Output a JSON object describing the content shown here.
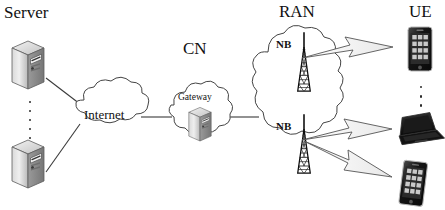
{
  "diagram": {
    "type": "network-topology",
    "background_color": "#ffffff",
    "line_color": "#333333",
    "groups": [
      {
        "id": "server",
        "label": "Server"
      },
      {
        "id": "cn",
        "label": "CN"
      },
      {
        "id": "ran",
        "label": "RAN"
      },
      {
        "id": "ue",
        "label": "UE"
      }
    ],
    "clouds": [
      {
        "id": "internet",
        "label": "Internet"
      },
      {
        "id": "cn-cloud",
        "label": ""
      },
      {
        "id": "ran-cloud",
        "label": ""
      }
    ],
    "nodes": [
      {
        "id": "server-top",
        "label": "",
        "icon": "server-tower-icon"
      },
      {
        "id": "server-bottom",
        "label": "",
        "icon": "server-tower-icon"
      },
      {
        "id": "gateway",
        "label": "Gateway",
        "icon": "server-tower-icon"
      },
      {
        "id": "nodeb-top",
        "label": "NB",
        "icon": "cell-tower-icon"
      },
      {
        "id": "nodeb-bottom",
        "label": "NB",
        "icon": "cell-tower-icon"
      },
      {
        "id": "ue-phone-top",
        "label": "",
        "icon": "smartphone-icon"
      },
      {
        "id": "ue-laptop",
        "label": "",
        "icon": "laptop-icon"
      },
      {
        "id": "ue-phone-bottom",
        "label": "",
        "icon": "smartphone-icon"
      }
    ],
    "ellipses": [
      {
        "id": "server-ellipsis",
        "dots": 5,
        "orientation": "vertical"
      },
      {
        "id": "ue-ellipsis",
        "dots": 4,
        "orientation": "vertical"
      }
    ],
    "wired_links": [
      {
        "from": "server-top",
        "to": "internet"
      },
      {
        "from": "server-bottom",
        "to": "internet"
      },
      {
        "from": "internet",
        "to": "cn-cloud"
      },
      {
        "from": "cn-cloud",
        "to": "ran-cloud"
      }
    ],
    "wireless_links": [
      {
        "from": "nodeb-top",
        "to": "ue-phone-top",
        "style": "lightning-bolt"
      },
      {
        "from": "nodeb-bottom",
        "to": "ue-laptop",
        "style": "lightning-bolt"
      },
      {
        "from": "nodeb-bottom",
        "to": "ue-phone-bottom",
        "style": "lightning-bolt"
      }
    ]
  }
}
